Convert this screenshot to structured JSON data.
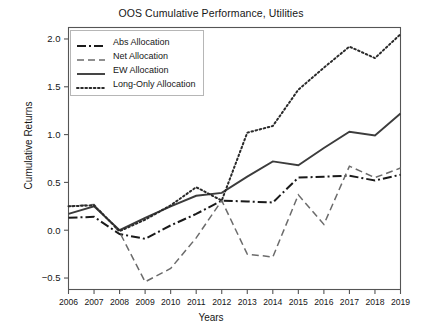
{
  "chart_data": {
    "type": "line",
    "title": "OOS Cumulative Performance, Utilities",
    "xlabel": "Years",
    "ylabel": "Cumulative Returns",
    "grid": false,
    "legend_position": "upper left",
    "categories": [
      2006,
      2007,
      2008,
      2009,
      2010,
      2011,
      2012,
      2013,
      2014,
      2015,
      2016,
      2017,
      2018,
      2019
    ],
    "xtick_labels": [
      "2006",
      "2007",
      "2008",
      "2009",
      "2010",
      "2011",
      "2012",
      "2013",
      "2014",
      "2015",
      "2016",
      "2017",
      "2018",
      "2019"
    ],
    "ytick_labels": [
      "-0.5",
      "0.0",
      "0.5",
      "1.0",
      "1.5",
      "2.0"
    ],
    "ytick_values": [
      -0.5,
      0.0,
      0.5,
      1.0,
      1.5,
      2.0
    ],
    "xlim": [
      2006,
      2019
    ],
    "ylim": [
      -0.62,
      2.12
    ],
    "series": [
      {
        "name": "Abs Allocation",
        "style": "dashdot",
        "color": "#1a1a1a",
        "values": [
          0.13,
          0.14,
          -0.04,
          -0.09,
          0.05,
          0.17,
          0.31,
          0.3,
          0.29,
          0.55,
          0.56,
          0.57,
          0.52,
          0.58
        ]
      },
      {
        "name": "Net Allocation",
        "style": "dashed",
        "color": "#6b6b6b",
        "values": [
          0.25,
          0.27,
          -0.02,
          -0.54,
          -0.4,
          -0.08,
          0.31,
          -0.25,
          -0.28,
          0.37,
          0.06,
          0.67,
          0.55,
          0.65
        ]
      },
      {
        "name": "EW Allocation",
        "style": "solid",
        "color": "#3c3c3c",
        "values": [
          0.17,
          0.25,
          0.0,
          0.13,
          0.25,
          0.36,
          0.39,
          0.56,
          0.72,
          0.68,
          0.86,
          1.03,
          0.99,
          1.22
        ]
      },
      {
        "name": "Long-Only Allocation",
        "style": "dotted",
        "color": "#2a2a2a",
        "values": [
          0.25,
          0.26,
          -0.01,
          0.11,
          0.26,
          0.45,
          0.31,
          1.02,
          1.09,
          1.47,
          1.7,
          1.92,
          1.8,
          2.05
        ]
      }
    ]
  },
  "legend": {
    "items": [
      {
        "label": "Abs Allocation"
      },
      {
        "label": "Net Allocation"
      },
      {
        "label": "EW Allocation"
      },
      {
        "label": "Long-Only Allocation"
      }
    ]
  }
}
